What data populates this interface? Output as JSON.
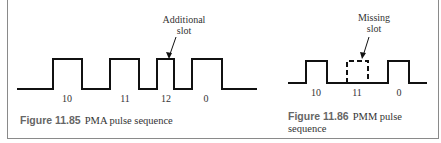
{
  "figures": [
    {
      "number": "Figure 11.85",
      "caption": "PMA pulse sequence",
      "annotation": {
        "line1": "Additional",
        "line2": "slot"
      },
      "slot_labels": [
        "10",
        "11",
        "12",
        "0"
      ]
    },
    {
      "number": "Figure 11.86",
      "caption": "PMM pulse",
      "caption_line2": "sequence",
      "annotation": {
        "line1": "Missing",
        "line2": "slot"
      },
      "slot_labels": [
        "10",
        "11",
        "0"
      ]
    }
  ]
}
